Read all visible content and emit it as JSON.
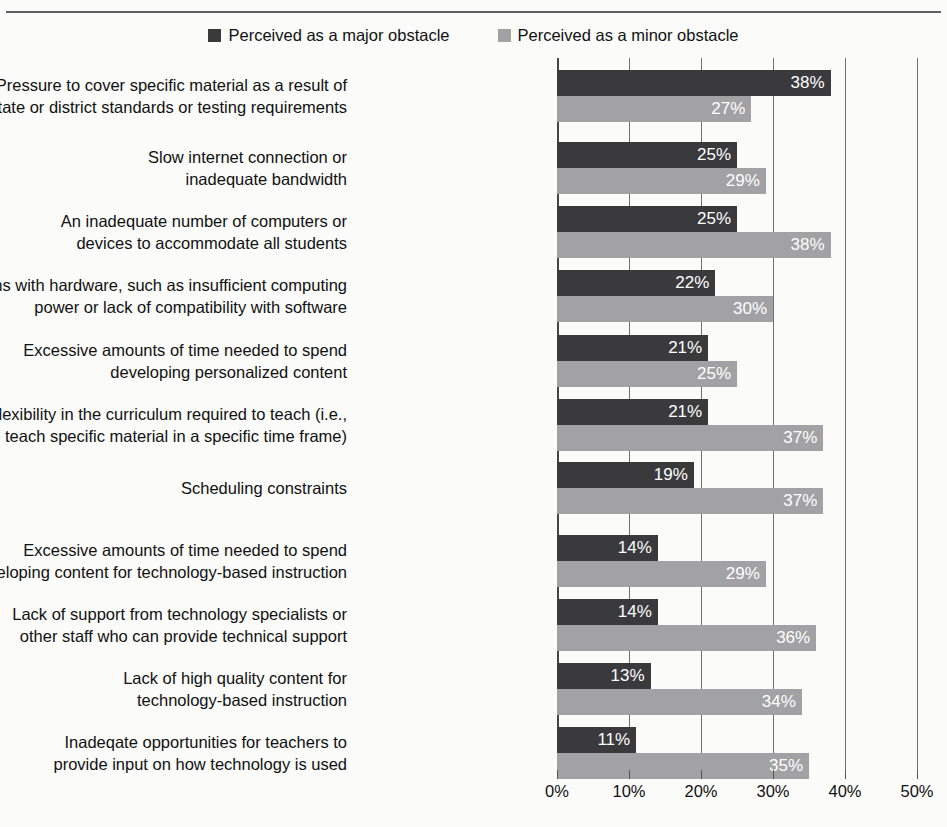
{
  "title": "",
  "legend": {
    "position": "top-center",
    "entries": [
      {
        "label": "Perceived as a major obstacle",
        "color": "#3a3a3c",
        "key": "major"
      },
      {
        "label": "Perceived as a minor obstacle",
        "color": "#a2a2a4",
        "key": "minor"
      }
    ]
  },
  "axis": {
    "ticks": [
      "0%",
      "10%",
      "20%",
      "30%",
      "40%",
      "50%"
    ],
    "tick_values": [
      0,
      10,
      20,
      30,
      40,
      50
    ]
  },
  "chart_data": {
    "type": "bar",
    "orientation": "horizontal",
    "title": "",
    "xlabel": "",
    "ylabel": "",
    "xlim": [
      0,
      50
    ],
    "grid": true,
    "legend_position": "top-center",
    "value_suffix": "%",
    "categories": [
      "Pressure to cover specific material as a result of\nstate or district standards or testing requirements",
      "Slow internet connection or\ninadequate bandwidth",
      "An inadequate number of computers or\ndevices to accommodate all students",
      "Problems with hardware, such as insufficient computing\npower or lack of compatibility with software",
      "Excessive amounts of time needed to spend\ndeveloping personalized content",
      "Lack of flexibility in the curriculum required to teach (i.e.,\nneed to teach specific material in a specific time frame)",
      "Scheduling constraints",
      "Excessive amounts of time needed to spend\ndeveloping content for technology-based instruction",
      "Lack of support from technology specialists or\nother staff who can provide technical support",
      "Lack of high quality content for\ntechnology-based instruction",
      "Inadeqate opportunities for teachers to\nprovide input on how technology is used"
    ],
    "series": [
      {
        "name": "Perceived as a major obstacle",
        "color": "#3a3a3c",
        "values": [
          38,
          25,
          25,
          22,
          21,
          21,
          19,
          14,
          14,
          13,
          11
        ],
        "labels": [
          "38%",
          "25%",
          "25%",
          "22%",
          "21%",
          "21%",
          "19%",
          "14%",
          "14%",
          "13%",
          "11%"
        ]
      },
      {
        "name": "Perceived as a minor obstacle",
        "color": "#a2a2a4",
        "values": [
          27,
          29,
          38,
          30,
          25,
          37,
          37,
          29,
          36,
          34,
          35
        ],
        "labels": [
          "27%",
          "29%",
          "38%",
          "30%",
          "25%",
          "37%",
          "37%",
          "29%",
          "36%",
          "34%",
          "35%"
        ]
      }
    ]
  }
}
